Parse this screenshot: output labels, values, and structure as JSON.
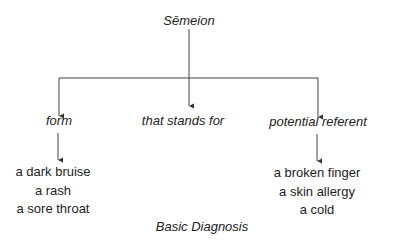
{
  "diagram": {
    "root": {
      "label": "Sēmeion"
    },
    "branches": [
      {
        "label": "form",
        "examples": [
          "a dark bruise",
          "a rash",
          "a sore throat"
        ]
      },
      {
        "label": "that stands for",
        "examples": []
      },
      {
        "label": "potential referent",
        "examples": [
          "a broken finger",
          "a skin allergy",
          "a cold"
        ]
      }
    ],
    "caption": "Basic Diagnosis"
  }
}
